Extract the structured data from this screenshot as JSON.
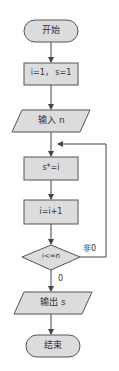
{
  "flowchart": {
    "nodes": [
      {
        "id": "start",
        "type": "terminal",
        "label": "开始"
      },
      {
        "id": "init",
        "type": "process",
        "label": "i=1， s=1"
      },
      {
        "id": "input",
        "type": "io",
        "label": "输入 n"
      },
      {
        "id": "multiply",
        "type": "process",
        "label": "s*=i"
      },
      {
        "id": "increment",
        "type": "process",
        "label": "i=i+1"
      },
      {
        "id": "condition",
        "type": "decision",
        "label": "i<=n"
      },
      {
        "id": "output",
        "type": "io",
        "label": "输出 s"
      },
      {
        "id": "end",
        "type": "terminal",
        "label": "结束"
      }
    ],
    "edge_labels": {
      "true_branch": "非0",
      "false_branch": "0"
    },
    "colors": {
      "fill": "#dcdcdc",
      "stroke": "#555555",
      "text": "#333333",
      "background": "#ffffff"
    }
  }
}
